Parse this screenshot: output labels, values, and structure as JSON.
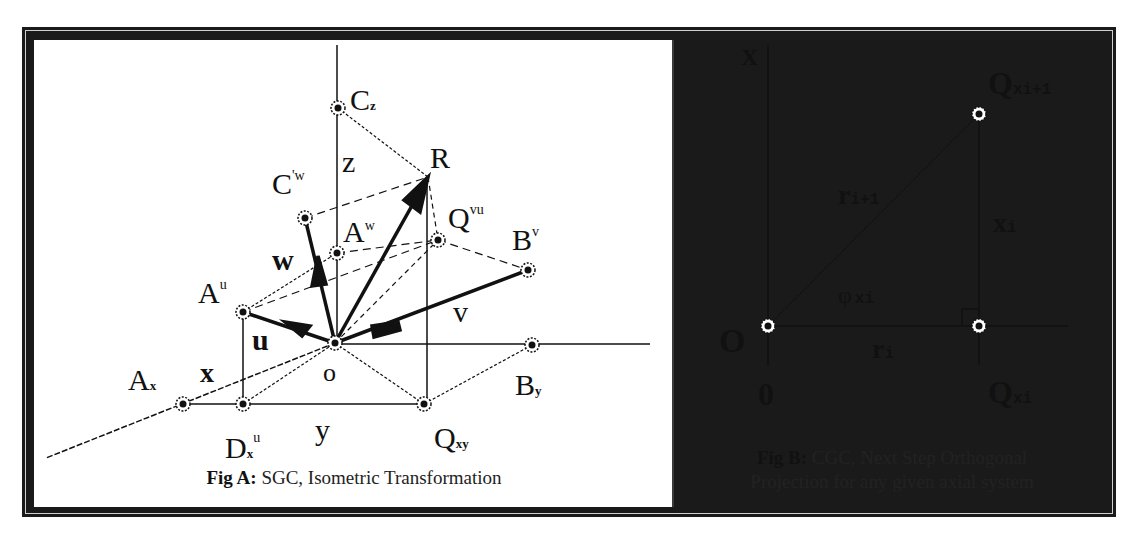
{
  "fig_a": {
    "caption_bold": "Fig A:",
    "caption_text": " SGC, Isometric Transformation",
    "labels": {
      "Cz": {
        "main": "C",
        "sub": "z"
      },
      "z": "z",
      "R": "R",
      "Cw": {
        "main": "C",
        "sup": "'w"
      },
      "Aw": {
        "main": "A",
        "sup": "w"
      },
      "Qvu": {
        "main": "Q",
        "sup": "vu"
      },
      "Bv": {
        "main": "B",
        "sup": "v"
      },
      "w": "w",
      "Au": {
        "main": "A",
        "sup": "u"
      },
      "u": "u",
      "v": "v",
      "o": "o",
      "x": "x",
      "Ax": {
        "main": "A",
        "sub": "x"
      },
      "By": {
        "main": "B",
        "sub": "y"
      },
      "Dxu": {
        "main": "D",
        "sub": "x",
        "sup": "u"
      },
      "y": "y",
      "Qxy": {
        "main": "Q",
        "sub": "xy"
      }
    }
  },
  "fig_b": {
    "caption_bold": "Fig B:",
    "caption_line1": " CGC, Next Step Orthogonal",
    "caption_line2": "Projection for any given axial system",
    "labels": {
      "X": "X",
      "Qxi1": {
        "main": "Q",
        "sub": "xi+1"
      },
      "ri1": {
        "main": "r",
        "sub": "i+1"
      },
      "xi": {
        "main": "x",
        "sub": "i"
      },
      "phi": {
        "main": "φ",
        "sub": "xi"
      },
      "O": "O",
      "ri": {
        "main": "r",
        "sub": "i"
      },
      "zero": "0",
      "Qxi": {
        "main": "Q",
        "sub": "xi"
      }
    }
  }
}
